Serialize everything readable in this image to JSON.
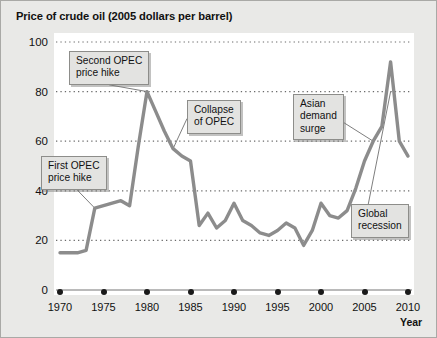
{
  "chart_data": {
    "type": "line",
    "title": "Price of crude oil (2005 dollars per barrel)",
    "xlabel": "Year",
    "ylabel": "",
    "xlim": [
      1970,
      2010
    ],
    "ylim": [
      0,
      100
    ],
    "grid": true,
    "legend": "none",
    "line_color": "#8c8c8c",
    "xticks": [
      1970,
      1975,
      1980,
      1985,
      1990,
      1995,
      2000,
      2005,
      2010
    ],
    "yticks": [
      0,
      20,
      40,
      60,
      80,
      100
    ],
    "series": [
      {
        "name": "Price of crude oil",
        "x": [
          1970,
          1971,
          1972,
          1973,
          1974,
          1975,
          1976,
          1977,
          1978,
          1979,
          1980,
          1981,
          1982,
          1983,
          1984,
          1985,
          1986,
          1987,
          1988,
          1989,
          1990,
          1991,
          1992,
          1993,
          1994,
          1995,
          1996,
          1997,
          1998,
          1999,
          2000,
          2001,
          2002,
          2003,
          2004,
          2005,
          2006,
          2007,
          2008,
          2009,
          2010
        ],
        "values": [
          15,
          15,
          15,
          16,
          33,
          34,
          35,
          36,
          34,
          58,
          80,
          72,
          64,
          57,
          54,
          52,
          26,
          31,
          25,
          28,
          35,
          28,
          26,
          23,
          22,
          24,
          27,
          25,
          18,
          24,
          35,
          30,
          29,
          32,
          41,
          52,
          60,
          66,
          92,
          60,
          54
        ]
      }
    ],
    "annotations": [
      {
        "name": "first-opec-price-hike",
        "text": "First OPEC\nprice hike",
        "target_x": 1974,
        "target_y": 33
      },
      {
        "name": "second-opec-price-hike",
        "text": "Second OPEC\nprice hike",
        "target_x": 1980,
        "target_y": 80
      },
      {
        "name": "collapse-of-opec",
        "text": "Collapse\nof OPEC",
        "target_x": 1983,
        "target_y": 57
      },
      {
        "name": "asian-demand-surge",
        "text": "Asian\ndemand\nsurge",
        "target_x": 2006,
        "target_y": 60
      },
      {
        "name": "global-recession",
        "text": "Global\nrecession",
        "target_x": 2008,
        "target_y": 80
      }
    ]
  }
}
